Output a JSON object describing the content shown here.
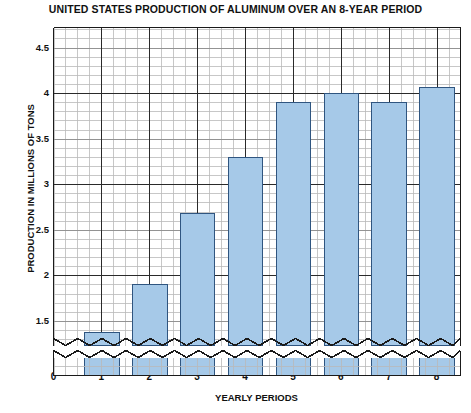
{
  "chart_data": {
    "type": "bar",
    "title": "UNITED STATES PRODUCTION OF ALUMINUM OVER AN 8-YEAR PERIOD",
    "xlabel": "YEARLY PERIODS",
    "ylabel": "PRODUCTION IN MILLIONS OF TONS",
    "categories": [
      "1",
      "2",
      "3",
      "4",
      "5",
      "6",
      "7",
      "8"
    ],
    "values": [
      1.38,
      1.9,
      2.68,
      3.3,
      3.9,
      4.0,
      3.9,
      4.07
    ],
    "x": [
      1,
      2,
      3,
      4,
      5,
      6,
      7,
      8
    ],
    "xlim": [
      0,
      8.5
    ],
    "ylim": [
      1.23,
      4.72
    ],
    "xticks": [
      "0",
      "1",
      "2",
      "3",
      "4",
      "5",
      "6",
      "7",
      "8"
    ],
    "yticks": [
      "1.5",
      "2",
      "2.5",
      "3",
      "3.5",
      "4",
      "4.5"
    ],
    "ytick_values": [
      1.5,
      2,
      2.5,
      3,
      3.5,
      4,
      4.5
    ],
    "grid": true,
    "minor_grid": true,
    "legend": "none",
    "axis_break": "y-axis broken below 1.5 (zigzag baseline)",
    "bar_fill_color": "#a6c9e8",
    "bar_edge_color": "#2f5580",
    "major_grid_color": "#2a2a2a",
    "minor_grid_color": "#b9b9b9",
    "axis_color": "#1a1a1a",
    "background_color": "#ffffff",
    "text_color": "#111111"
  }
}
